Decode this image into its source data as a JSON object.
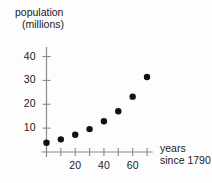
{
  "chart_data": {
    "type": "scatter",
    "title": "",
    "xlabel": "years since 1790",
    "ylabel": "population (millions)",
    "ylabel_line1": "population",
    "ylabel_line2": "(millions)",
    "xlabel_line1": "years",
    "xlabel_line2": "since 1790",
    "x": [
      0,
      10,
      20,
      30,
      40,
      50,
      60,
      70
    ],
    "values": [
      3.9,
      5.3,
      7.2,
      9.6,
      12.9,
      17.1,
      23.2,
      31.4
    ],
    "xticks": [
      0,
      10,
      20,
      30,
      40,
      50,
      60,
      70
    ],
    "xtick_labels": [
      "",
      "",
      "20",
      "",
      "40",
      "",
      "60",
      ""
    ],
    "yticks": [
      10,
      20,
      30,
      40
    ],
    "ytick_labels": [
      "10",
      "20",
      "30",
      "40"
    ],
    "xlim": [
      -3,
      74
    ],
    "ylim": [
      0,
      44
    ],
    "grid": false,
    "legend": false,
    "marker": "filled-circle",
    "marker_color": "#111111",
    "axis_color": "#8a8a8a",
    "background": "#fdfdfd"
  }
}
